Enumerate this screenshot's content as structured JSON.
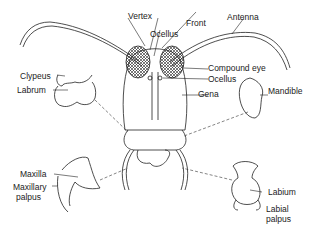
{
  "diagram": {
    "labels": {
      "vertex": "Vertex",
      "front": "Front",
      "antenna": "Antenna",
      "ocellus_top": "Ocellus",
      "compound_eye": "Compound eye",
      "ocellus_side": "Ocellus",
      "gena": "Gena",
      "clypeus": "Clypeus",
      "labrum": "Labrum",
      "mandible": "Mandible",
      "maxilla": "Maxilla",
      "maxillary_palpus_1": "Maxillary",
      "maxillary_palpus_2": "palpus",
      "labium": "Labium",
      "labial_palpus_1": "Labial",
      "labial_palpus_2": "palpus"
    },
    "colors": {
      "line": "#222222",
      "background": "#ffffff"
    }
  }
}
